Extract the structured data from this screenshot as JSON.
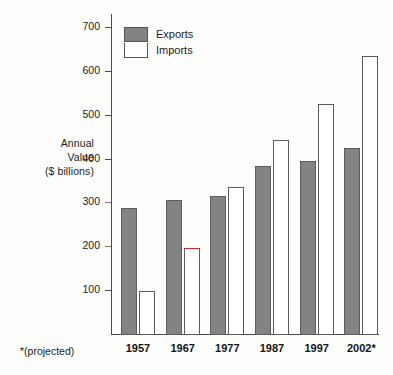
{
  "chart_data": {
    "type": "bar",
    "title": "",
    "xlabel": "",
    "ylabel": "Annual Value ($ billions)",
    "ylabel_lines": [
      "Annual",
      "Value",
      "($ billions)"
    ],
    "categories": [
      "1957",
      "1967",
      "1977",
      "1987",
      "1997",
      "2002*"
    ],
    "series": [
      {
        "name": "Exports",
        "color": "#838383",
        "values": [
          289,
          308,
          316,
          385,
          398,
          426
        ]
      },
      {
        "name": "Imports",
        "color": "#ffffff",
        "values": [
          100,
          199,
          337,
          445,
          528,
          637
        ]
      }
    ],
    "ylim": [
      0,
      730
    ],
    "yticks": [
      100,
      200,
      300,
      400,
      500,
      600,
      700
    ],
    "ytick_labels": [
      "100",
      "200",
      "300",
      "400",
      "500",
      "600",
      "700"
    ],
    "grid": false,
    "legend_position": "top-left",
    "annotations": [
      {
        "text": "*(projected)",
        "position": "below-axis-left"
      },
      {
        "text": "red highlight on 1967 Imports bar top",
        "series": "Imports",
        "category": "1967",
        "color": "#d4292b"
      }
    ]
  },
  "legend": {
    "items": [
      {
        "label": "Exports"
      },
      {
        "label": "Imports"
      }
    ]
  },
  "footnote": {
    "text": "*(projected)"
  },
  "colors": {
    "exports_fill": "#838383",
    "imports_fill": "#ffffff",
    "axis": "#4a4a4a",
    "highlight": "#d4292b",
    "background": "#fdfdfc"
  }
}
